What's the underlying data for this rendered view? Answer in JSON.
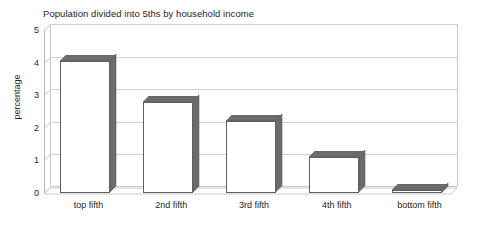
{
  "chart_data": {
    "type": "bar",
    "title": "Population divided into 5ths by household income",
    "xlabel": "",
    "ylabel": "percentage",
    "categories": [
      "top fifth",
      "2nd fifth",
      "3rd fifth",
      "4th fifth",
      "bottom fifth"
    ],
    "values": [
      4.05,
      2.8,
      2.2,
      1.1,
      0.1
    ],
    "ylim": [
      0,
      5
    ],
    "yticks": [
      0,
      1,
      2,
      3,
      4,
      5
    ],
    "ytick_labels": [
      "0",
      "1",
      "2",
      "3",
      "4",
      "5"
    ],
    "grid": true,
    "legend": false,
    "style": "3d",
    "colors": {
      "bar_front": "#ffffff",
      "bar_outline": "#5f5f5f",
      "bar_side": "#6b6b6b",
      "bar_top": "#6b6b6b",
      "gridline": "#d2d2d2",
      "axis": "#b5b5b5",
      "text": "#262626",
      "background": "#ffffff"
    }
  }
}
